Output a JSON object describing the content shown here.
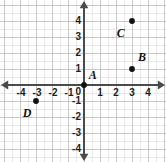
{
  "chart_data": {
    "type": "scatter",
    "title": "",
    "xlabel": "",
    "ylabel": "",
    "xlim": [
      -4.6,
      4.8
    ],
    "ylim": [
      -4.6,
      4.8
    ],
    "grid": true,
    "minor_grid": true,
    "legend": "none",
    "axis_arrows": true,
    "x_ticks": [
      "-4",
      "-3",
      "-2",
      "-1",
      "1",
      "2",
      "3",
      "4"
    ],
    "x_tick_values": [
      -4,
      -3,
      -2,
      -1,
      1,
      2,
      3,
      4
    ],
    "y_ticks": [
      "4",
      "3",
      "2",
      "1",
      "-1",
      "-2",
      "-3",
      "-4"
    ],
    "y_tick_values": [
      4,
      3,
      2,
      1,
      -1,
      -2,
      -3,
      -4
    ],
    "origin_label": "0",
    "points": [
      {
        "label": "A",
        "x": 0,
        "y": 0,
        "label_dx": 0.55,
        "label_dy": 0.62
      },
      {
        "label": "B",
        "x": 3,
        "y": 1,
        "label_dx": 0.62,
        "label_dy": 0.78
      },
      {
        "label": "C",
        "x": 3,
        "y": 4,
        "label_dx": -0.7,
        "label_dy": -0.72
      },
      {
        "label": "D",
        "x": -3,
        "y": -1,
        "label_dx": -0.55,
        "label_dy": -0.78
      }
    ]
  },
  "style": {
    "background": "#ffffff",
    "major_grid_color": "#c9c9c9",
    "minor_grid_color": "#e8e8e8",
    "axis_color": "#4a4a4a",
    "point_color": "#111111",
    "tick_text_color": "#1d1d1d",
    "label_text_color": "#111111"
  },
  "geometry": {
    "origin_x": 84,
    "origin_y": 85,
    "unit_px": 16,
    "point_radius": 2.9,
    "width": 166,
    "height": 162
  }
}
